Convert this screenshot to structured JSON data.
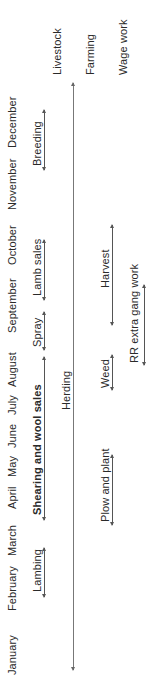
{
  "months": [
    "January",
    "February",
    "March",
    "April",
    "May",
    "June",
    "July",
    "August",
    "September",
    "October",
    "November",
    "December"
  ],
  "categories": {
    "livestock": "Livestock",
    "farming": "Farming",
    "wage_work": "Wage work"
  },
  "livestock_activities": {
    "lambing": "Lambing",
    "shearing": "Shearing and wool sales",
    "spray": "Spray",
    "lamb_sales": "Lamb sales",
    "breeding": "Breeding"
  },
  "herding": "Herding",
  "farming_activities": {
    "plow": "Plow and plant",
    "weed": "Weed",
    "harvest": "Harvest"
  },
  "wage_activities": {
    "rr": "RR extra gang work"
  },
  "colors": {
    "text": "#2a2a2a",
    "line": "#555555",
    "background": "#ffffff"
  }
}
